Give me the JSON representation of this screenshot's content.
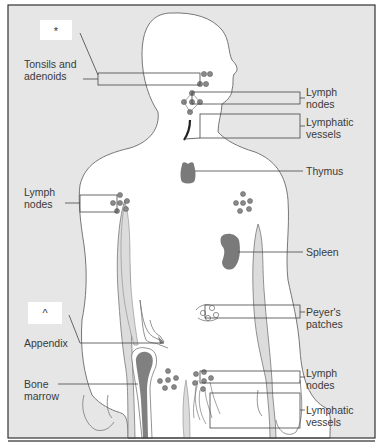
{
  "diagram": {
    "markers": [
      {
        "id": "marker-top",
        "text": "*"
      },
      {
        "id": "marker-bottom",
        "text": "^"
      }
    ],
    "labels": {
      "tonsils": {
        "line1": "Tonsils and",
        "line2": "adenoids"
      },
      "lymph_nodes_neck": {
        "line1": "Lymph",
        "line2": "nodes"
      },
      "lymphatic_vessels_neck": {
        "line1": "Lymphatic",
        "line2": "vessels"
      },
      "thymus": {
        "line1": "Thymus"
      },
      "lymph_nodes_axilla": {
        "line1": "Lymph",
        "line2": "nodes"
      },
      "spleen": {
        "line1": "Spleen"
      },
      "peyers_patches": {
        "line1": "Peyer's",
        "line2": "patches"
      },
      "appendix": {
        "line1": "Appendix"
      },
      "bone_marrow": {
        "line1": "Bone",
        "line2": "marrow"
      },
      "lymph_nodes_groin": {
        "line1": "Lymph",
        "line2": "nodes"
      },
      "lymphatic_vessels_groin": {
        "line1": "Lymphatic",
        "line2": "vessels"
      }
    },
    "colors": {
      "background": "#e6e6e6",
      "body_fill": "#ffffff",
      "outline": "#777777",
      "organ_fill": "#7a7a7a",
      "node_fill": "#8a8a8a",
      "bone_light": "#dcdcdc",
      "frame": "#333333"
    }
  }
}
